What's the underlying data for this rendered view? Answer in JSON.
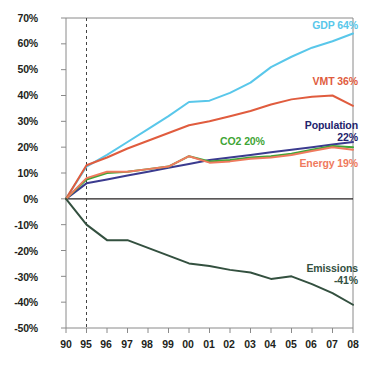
{
  "chart_data": {
    "type": "line",
    "title": "",
    "subtitle": "",
    "xlabel": "",
    "ylabel": "",
    "x": [
      "90",
      "95",
      "96",
      "97",
      "98",
      "99",
      "00",
      "01",
      "02",
      "03",
      "04",
      "05",
      "06",
      "07",
      "08"
    ],
    "ylim": [
      -50,
      70
    ],
    "yticks": [
      70,
      60,
      50,
      40,
      30,
      20,
      10,
      0,
      -10,
      -20,
      -30,
      -40,
      -50
    ],
    "ytick_labels": [
      "70%",
      "60%",
      "50%",
      "40%",
      "30%",
      "20%",
      "10%",
      "0%",
      "-10%",
      "-20%",
      "-30%",
      "-40%",
      "-50%"
    ],
    "grid": false,
    "legend": "inline-end-labels",
    "annotations": [
      {
        "name": "baseline-year-marker",
        "type": "vertical-dashed-line",
        "x": "95"
      },
      {
        "name": "zero-line",
        "type": "horizontal-line",
        "y": 0
      }
    ],
    "series": [
      {
        "name": "GDP",
        "label": "GDP",
        "end_value_label": "64%",
        "color": "#59c7ea",
        "values": [
          0,
          12.5,
          17,
          22,
          27,
          32,
          37.5,
          38,
          41,
          45,
          51,
          55,
          58.5,
          61,
          64
        ]
      },
      {
        "name": "VMT",
        "label": "VMT",
        "end_value_label": "36%",
        "color": "#e05c3e",
        "values": [
          0,
          13,
          16,
          19.5,
          22.5,
          25.5,
          28.5,
          30,
          32,
          34,
          36.5,
          38.5,
          39.5,
          40,
          36
        ]
      },
      {
        "name": "Population",
        "label": "Population",
        "end_value_label": "22%",
        "color": "#3b3b8f",
        "values": [
          0,
          6,
          7.5,
          9,
          10.5,
          12,
          13.5,
          15,
          16,
          17,
          18,
          19,
          20,
          21,
          22
        ]
      },
      {
        "name": "CO2",
        "label": "CO2",
        "end_value_label": "20%",
        "color": "#3fa535",
        "values": [
          0,
          7.5,
          10,
          10.5,
          11.5,
          12.5,
          16.5,
          14.5,
          15,
          16,
          16.5,
          17.5,
          19,
          20.5,
          20
        ]
      },
      {
        "name": "Energy",
        "label": "Energy",
        "end_value_label": "19%",
        "color": "#ef7a5e",
        "values": [
          0,
          8,
          10.5,
          10.5,
          11.5,
          12.5,
          16.5,
          14,
          14.5,
          15.5,
          16,
          17,
          18.5,
          20,
          19
        ]
      },
      {
        "name": "Emissions",
        "label": "Emissions",
        "end_value_label": "-41%",
        "color": "#33503f",
        "values": [
          0,
          -10,
          -16,
          -16,
          -19,
          -22,
          -25,
          -26,
          -27.5,
          -28.5,
          -31,
          -30,
          -33,
          -36.5,
          -41
        ]
      }
    ]
  },
  "labels": {
    "gdp": {
      "name": "GDP",
      "value": "64%"
    },
    "vmt": {
      "name": "VMT",
      "value": "36%"
    },
    "population": {
      "name": "Population",
      "value": "22%"
    },
    "co2": {
      "name": "CO2",
      "value": "20%"
    },
    "energy": {
      "name": "Energy",
      "value": "19%"
    },
    "emissions": {
      "name": "Emissions",
      "value": "-41%"
    }
  }
}
